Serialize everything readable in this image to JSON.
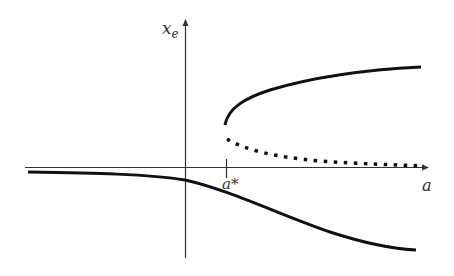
{
  "diagram": {
    "y_axis_label": "x",
    "y_axis_subscript": "e",
    "x_axis_label": "a",
    "critical_point_label": "a*",
    "colors": {
      "axis": "#333333",
      "curve": "#111111",
      "background": "#ffffff"
    },
    "branches": [
      {
        "name": "lower-stable-branch",
        "style": "solid"
      },
      {
        "name": "upper-stable-branch",
        "style": "solid"
      },
      {
        "name": "unstable-branch",
        "style": "dotted"
      }
    ]
  }
}
